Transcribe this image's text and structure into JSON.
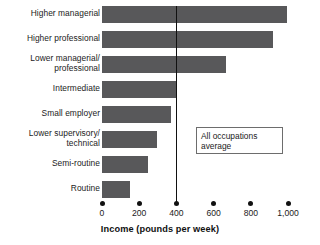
{
  "chart_data": {
    "type": "bar",
    "orientation": "horizontal",
    "title": "",
    "subtitle": "",
    "xlabel": "Income (pounds per week)",
    "ylabel": "",
    "xlim": [
      0,
      1000
    ],
    "xticks": [
      0,
      200,
      400,
      600,
      800,
      1000
    ],
    "xtick_labels": [
      "0",
      "200",
      "400",
      "600",
      "800",
      "1,000"
    ],
    "grid": false,
    "legend": null,
    "bar_color": "#58585a",
    "categories": [
      "Higher managerial",
      "Higher professional",
      "Lower managerial/\nprofessional",
      "Intermediate",
      "Small employer",
      "Lower supervisory/\ntechnical",
      "Semi-routine",
      "Routine"
    ],
    "values": [
      995,
      920,
      665,
      400,
      370,
      295,
      245,
      150
    ],
    "annotations": [
      {
        "name": "all-occupations-average",
        "text": "All occupations average",
        "text_line_1": "All occupations",
        "text_line_2": "average",
        "value": 400,
        "type": "vertical-reference-line"
      }
    ]
  },
  "axis": {
    "x_title": "Income (pounds per week)",
    "ticks": [
      {
        "label": "0",
        "value": 0
      },
      {
        "label": "200",
        "value": 200
      },
      {
        "label": "400",
        "value": 400
      },
      {
        "label": "600",
        "value": 600
      },
      {
        "label": "800",
        "value": 800
      },
      {
        "label": "1,000",
        "value": 1000
      }
    ]
  },
  "callout": {
    "line_1": "All occupations",
    "line_2": "average"
  }
}
